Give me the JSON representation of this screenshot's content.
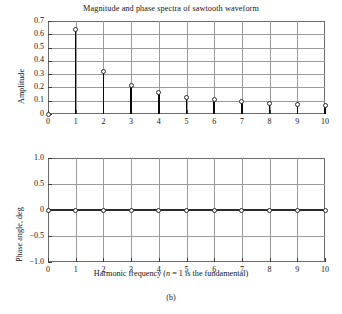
{
  "figure": {
    "caption": "(b)"
  },
  "chart_data": [
    {
      "type": "bar",
      "panel": "magnitude",
      "title": "Magnitude and phase spectra of sawtooth waveform",
      "xlabel": "",
      "ylabel": "Amplitude",
      "categories": [
        0,
        1,
        2,
        3,
        4,
        5,
        6,
        7,
        8,
        9,
        10
      ],
      "values": [
        0.0,
        0.637,
        0.318,
        0.212,
        0.159,
        0.127,
        0.106,
        0.091,
        0.08,
        0.071,
        0.064
      ],
      "xlim": [
        0,
        10
      ],
      "ylim": [
        0,
        0.7
      ],
      "xticks": [
        0,
        1,
        2,
        3,
        4,
        5,
        6,
        7,
        8,
        9,
        10
      ],
      "xtick_labels": [
        "0",
        "1",
        "2",
        "3",
        "4",
        "5",
        "6",
        "7",
        "8",
        "9",
        "10"
      ],
      "yticks": [
        0,
        0.1,
        0.2,
        0.3,
        0.4,
        0.5,
        0.6,
        0.7
      ],
      "ytick_labels": [
        "0",
        "0.1",
        "0.2",
        "0.3",
        "0.4",
        "0.5",
        "0.6",
        "0.7"
      ],
      "grid": true,
      "legend": "none",
      "marker": "open-circle",
      "stem": true
    },
    {
      "type": "scatter",
      "panel": "phase",
      "title": "",
      "xlabel": "Harmonic frequency (n = 1 is the fundamental)",
      "xlabel_parts": {
        "before": "Harmonic frequency (",
        "italic": "n",
        "after": " = 1 is the fundamental)"
      },
      "ylabel": "Phase angle, deg",
      "categories": [
        0,
        1,
        2,
        3,
        4,
        5,
        6,
        7,
        8,
        9,
        10
      ],
      "values": [
        0,
        0,
        0,
        0,
        0,
        0,
        0,
        0,
        0,
        0,
        0
      ],
      "xlim": [
        0,
        10
      ],
      "ylim": [
        -1.0,
        1.0
      ],
      "xticks": [
        0,
        1,
        2,
        3,
        4,
        5,
        6,
        7,
        8,
        9,
        10
      ],
      "xtick_labels": [
        "0",
        "1",
        "2",
        "3",
        "4",
        "5",
        "6",
        "7",
        "8",
        "9",
        "10"
      ],
      "yticks": [
        -1.0,
        -0.5,
        0,
        0.5,
        1.0
      ],
      "ytick_labels": [
        "−1.0",
        "−0.5",
        "0",
        "0.5",
        "1.0"
      ],
      "grid": true,
      "legend": "none",
      "marker": "open-circle",
      "stem": false
    }
  ],
  "colors": {
    "frame": "#6b6b6b",
    "grid": "#9a9a9a",
    "stem": "#0a0a0a",
    "marker_edge": "#2a2a2a",
    "marker_fill": "#ffffff",
    "text": "#141414",
    "background": "#ffffff"
  }
}
